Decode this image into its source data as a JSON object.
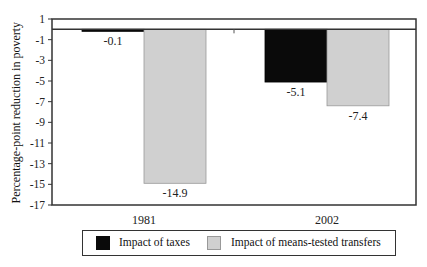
{
  "chart_data": {
    "type": "bar",
    "title": "",
    "xlabel": "",
    "ylabel": "Percentage-point reduction in poverty",
    "categories": [
      "1981",
      "2002"
    ],
    "series": [
      {
        "name": "Impact of taxes",
        "values": [
          -0.1,
          -5.1
        ],
        "color": "#0a0a0a"
      },
      {
        "name": "Impact of means-tested transfers",
        "values": [
          -14.9,
          -7.4
        ],
        "color": "#d0d0d0"
      }
    ],
    "data_labels": [
      [
        "-0.1",
        "-5.1"
      ],
      [
        "-14.9",
        "-7.4"
      ]
    ],
    "ylim": [
      -17,
      1
    ],
    "yticks": [
      1,
      -1,
      -3,
      -5,
      -7,
      -9,
      -11,
      -13,
      -15,
      -17
    ],
    "grid": false,
    "legend_position": "bottom"
  },
  "legend": {
    "items": [
      {
        "label": "Impact of taxes"
      },
      {
        "label": "Impact of means-tested transfers"
      }
    ]
  },
  "axis": {
    "ylabel": "Percentage-point reduction in poverty"
  }
}
